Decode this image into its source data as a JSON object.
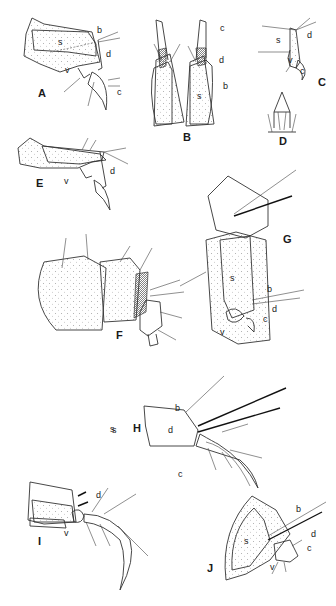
{
  "figure": {
    "type": "scientific-illustration-plate",
    "background": "#ffffff",
    "ink_color": "#222222",
    "panels": [
      {
        "id": "A",
        "label": "A",
        "parts": [
          "s",
          "b",
          "d",
          "v",
          "c"
        ]
      },
      {
        "id": "B",
        "label": "B",
        "parts": [
          "c",
          "d",
          "b",
          "s"
        ]
      },
      {
        "id": "C",
        "label": "C",
        "parts": [
          "s",
          "d",
          "v",
          "c"
        ]
      },
      {
        "id": "D",
        "label": "D",
        "parts": []
      },
      {
        "id": "E",
        "label": "E",
        "parts": [
          "d",
          "v"
        ]
      },
      {
        "id": "F",
        "label": "F",
        "parts": []
      },
      {
        "id": "G",
        "label": "G",
        "parts": [
          "s",
          "b",
          "d",
          "c",
          "v"
        ]
      },
      {
        "id": "H",
        "label": "H",
        "parts": [
          "s",
          "b",
          "d",
          "c"
        ]
      },
      {
        "id": "I",
        "label": "I",
        "parts": [
          "d",
          "v"
        ]
      },
      {
        "id": "J",
        "label": "J",
        "parts": [
          "s",
          "b",
          "d",
          "c",
          "v"
        ]
      }
    ]
  },
  "labels": {
    "s": "s",
    "b": "b",
    "d": "d",
    "c": "c",
    "v": "v",
    "A": "A",
    "B": "B",
    "C": "C",
    "D": "D",
    "E": "E",
    "F": "F",
    "G": "G",
    "H": "H",
    "I": "I",
    "J": "J"
  }
}
